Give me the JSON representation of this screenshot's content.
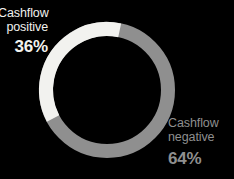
{
  "chart_data": {
    "type": "pie",
    "variant": "donut",
    "title": "",
    "subtitle": "",
    "xlabel": "",
    "ylabel": "",
    "legend_position": "inline-callouts",
    "grid": false,
    "total": 100,
    "unit": "%",
    "categories": [
      "Cashflow positive",
      "Cashflow negative"
    ],
    "values": [
      36,
      64
    ],
    "slices": [
      {
        "name": "Cashflow positive",
        "label_line1": "Cashflow",
        "label_line2": "positive",
        "value": 36,
        "value_label": "36%",
        "color": "#f2f2ef"
      },
      {
        "name": "Cashflow negative",
        "label_line1": "Cashflow",
        "label_line2": "negative",
        "value": 64,
        "value_label": "64%",
        "color": "#8f8f8f"
      }
    ]
  },
  "colors": {
    "background": "#000000",
    "positive": "#f2f2ef",
    "negative": "#8f8f8f"
  },
  "geometry": {
    "center_x": 107,
    "center_y": 90,
    "outer_radius": 68,
    "ring_thickness": 14,
    "start_angle_deg": 12,
    "direction": "counter-clockwise"
  }
}
